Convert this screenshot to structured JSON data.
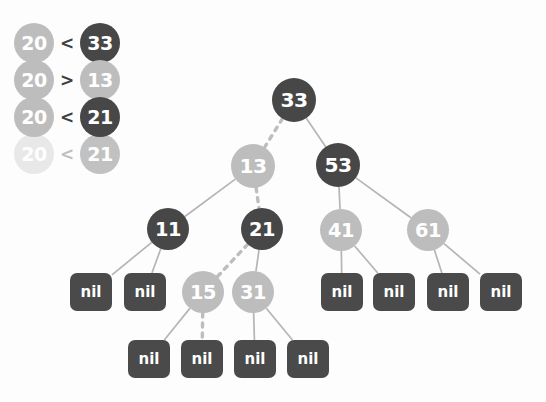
{
  "canvas": {
    "width": 546,
    "height": 402,
    "background": "#fdfdfd"
  },
  "colors": {
    "node_dark": "#474747",
    "node_light": "#bdbdbd",
    "nil_box": "#4a4a4a",
    "edge_solid": "#b5b5b5",
    "edge_dashed": "#bdbdbd",
    "text_on_node": "#ffffff",
    "operator_text": "#3f3f3f"
  },
  "legend": {
    "title": "search comparisons",
    "rows": [
      {
        "left": "20",
        "op": "<",
        "right": "33",
        "left_shade": "light",
        "right_shade": "dark",
        "opacity": 1.0
      },
      {
        "left": "20",
        "op": ">",
        "right": "13",
        "left_shade": "light",
        "right_shade": "light",
        "opacity": 1.0
      },
      {
        "left": "20",
        "op": "<",
        "right": "21",
        "left_shade": "light",
        "right_shade": "dark",
        "opacity": 1.0
      },
      {
        "left": "20",
        "op": "<",
        "right": "21",
        "left_shade": "light",
        "right_shade": "dark",
        "opacity": 0.32
      }
    ]
  },
  "tree": {
    "type": "red-black-binary-search-tree",
    "search_key": "20",
    "nodes": [
      {
        "id": "n33",
        "label": "33",
        "shade": "dark",
        "cx": 294,
        "cy": 100,
        "r": 22
      },
      {
        "id": "n13",
        "label": "13",
        "shade": "light",
        "cx": 253,
        "cy": 166,
        "r": 22
      },
      {
        "id": "n53",
        "label": "53",
        "shade": "dark",
        "cx": 338,
        "cy": 165,
        "r": 22
      },
      {
        "id": "n11",
        "label": "11",
        "shade": "dark",
        "cx": 168,
        "cy": 229,
        "r": 21
      },
      {
        "id": "n21",
        "label": "21",
        "shade": "dark",
        "cx": 262,
        "cy": 229,
        "r": 21
      },
      {
        "id": "n41",
        "label": "41",
        "shade": "light",
        "cx": 341,
        "cy": 230,
        "r": 21
      },
      {
        "id": "n61",
        "label": "61",
        "shade": "light",
        "cx": 428,
        "cy": 230,
        "r": 21
      },
      {
        "id": "n15",
        "label": "15",
        "shade": "light",
        "cx": 203,
        "cy": 292,
        "r": 21
      },
      {
        "id": "n31",
        "label": "31",
        "shade": "light",
        "cx": 253,
        "cy": 292,
        "r": 21
      }
    ],
    "nil_leaves": [
      {
        "id": "l1",
        "label": "nil",
        "x": 70,
        "y": 273,
        "w": 42,
        "h": 38
      },
      {
        "id": "l2",
        "label": "nil",
        "x": 124,
        "y": 273,
        "w": 42,
        "h": 38
      },
      {
        "id": "l3",
        "label": "nil",
        "x": 321,
        "y": 273,
        "w": 42,
        "h": 38
      },
      {
        "id": "l4",
        "label": "nil",
        "x": 373,
        "y": 273,
        "w": 42,
        "h": 38
      },
      {
        "id": "l5",
        "label": "nil",
        "x": 427,
        "y": 273,
        "w": 42,
        "h": 38
      },
      {
        "id": "l6",
        "label": "nil",
        "x": 480,
        "y": 273,
        "w": 42,
        "h": 38
      },
      {
        "id": "l7",
        "label": "nil",
        "x": 128,
        "y": 340,
        "w": 42,
        "h": 38
      },
      {
        "id": "l8",
        "label": "nil",
        "x": 181,
        "y": 340,
        "w": 42,
        "h": 38
      },
      {
        "id": "l9",
        "label": "nil",
        "x": 234,
        "y": 340,
        "w": 42,
        "h": 38
      },
      {
        "id": "l10",
        "label": "nil",
        "x": 287,
        "y": 340,
        "w": 42,
        "h": 38
      }
    ],
    "edges": [
      {
        "from": "n33",
        "to": "n13",
        "style": "dashed",
        "on_search_path": true
      },
      {
        "from": "n33",
        "to": "n53",
        "style": "solid",
        "on_search_path": false
      },
      {
        "from": "n13",
        "to": "n11",
        "style": "solid",
        "on_search_path": false
      },
      {
        "from": "n13",
        "to": "n21",
        "style": "dashed",
        "on_search_path": true
      },
      {
        "from": "n53",
        "to": "n41",
        "style": "solid",
        "on_search_path": false
      },
      {
        "from": "n53",
        "to": "n61",
        "style": "solid",
        "on_search_path": false
      },
      {
        "from": "n11",
        "to": "l1",
        "style": "solid",
        "on_search_path": false
      },
      {
        "from": "n11",
        "to": "l2",
        "style": "solid",
        "on_search_path": false
      },
      {
        "from": "n21",
        "to": "n15",
        "style": "dashed",
        "on_search_path": true
      },
      {
        "from": "n21",
        "to": "n31",
        "style": "solid",
        "on_search_path": false
      },
      {
        "from": "n41",
        "to": "l3",
        "style": "solid",
        "on_search_path": false
      },
      {
        "from": "n41",
        "to": "l4",
        "style": "solid",
        "on_search_path": false
      },
      {
        "from": "n61",
        "to": "l5",
        "style": "solid",
        "on_search_path": false
      },
      {
        "from": "n61",
        "to": "l6",
        "style": "solid",
        "on_search_path": false
      },
      {
        "from": "n15",
        "to": "l7",
        "style": "solid",
        "on_search_path": false
      },
      {
        "from": "n15",
        "to": "l8",
        "style": "dashed",
        "on_search_path": true
      },
      {
        "from": "n31",
        "to": "l9",
        "style": "solid",
        "on_search_path": false
      },
      {
        "from": "n31",
        "to": "l10",
        "style": "solid",
        "on_search_path": false
      }
    ]
  }
}
